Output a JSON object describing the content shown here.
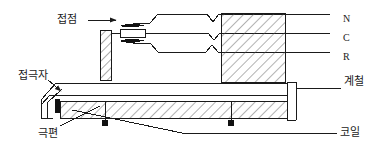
{
  "diagram": {
    "type": "cross-section-schematic",
    "stroke_color": "#1a1a1a",
    "hatch_color": "#555555",
    "background": "#ffffff",
    "labels": [
      {
        "id": "contact",
        "text": "접점",
        "x": 57,
        "y": 14,
        "leader": "horizontal-arrow-right"
      },
      {
        "id": "armature",
        "text": "접극자",
        "x": 18,
        "y": 70,
        "leader": "diagonal-arrow-down-right"
      },
      {
        "id": "pole",
        "text": "극편",
        "x": 38,
        "y": 128,
        "leader": "diagonal-line-up-right"
      },
      {
        "id": "yoke",
        "text": "계철",
        "x": 344,
        "y": 76,
        "leader": "horizontal-line-left"
      },
      {
        "id": "coil",
        "text": "코일",
        "x": 340,
        "y": 127,
        "leader": "horizontal-line-left"
      }
    ],
    "terminals": [
      {
        "id": "n",
        "text": "N",
        "x": 343,
        "y": 14
      },
      {
        "id": "c",
        "text": "C",
        "x": 343,
        "y": 33
      },
      {
        "id": "r",
        "text": "R",
        "x": 343,
        "y": 52
      }
    ],
    "components": [
      {
        "id": "core-block",
        "name": "hatched-core-block",
        "x": 221,
        "y": 13,
        "w": 64,
        "h": 69
      },
      {
        "id": "vertical-post",
        "name": "hatched-vertical-post",
        "x": 100,
        "y": 30,
        "w": 11,
        "h": 50
      },
      {
        "id": "coil-band",
        "name": "hatched-coil-band",
        "x": 55,
        "y": 101,
        "w": 232,
        "h": 17
      },
      {
        "id": "armature-bar",
        "name": "armature-bar",
        "x": 40,
        "y": 83,
        "w": 247,
        "h": 12
      },
      {
        "id": "yoke-leg",
        "name": "right-yoke-vertical-leg",
        "x": 287,
        "y": 82,
        "w": 9,
        "h": 38
      }
    ],
    "nodes": [
      {
        "id": "node-left",
        "x": 105,
        "y": 123
      },
      {
        "id": "node-right",
        "x": 231,
        "y": 123
      }
    ]
  }
}
